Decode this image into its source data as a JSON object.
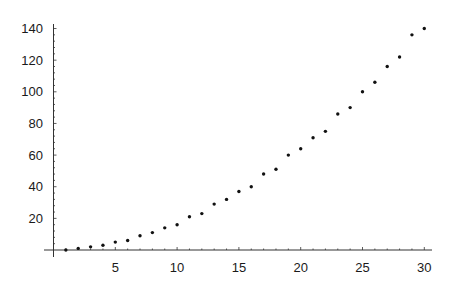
{
  "chart_data": {
    "type": "scatter",
    "title": "",
    "xlabel": "",
    "ylabel": "",
    "xlim": [
      0,
      30.5
    ],
    "ylim": [
      0,
      140
    ],
    "grid": false,
    "legend": null,
    "x_ticks": [
      5,
      10,
      15,
      20,
      25,
      30
    ],
    "y_ticks": [
      20,
      40,
      60,
      80,
      100,
      120,
      140
    ],
    "x_tick_labels": [
      "5",
      "10",
      "15",
      "20",
      "25",
      "30"
    ],
    "y_tick_labels": [
      "20",
      "40",
      "60",
      "80",
      "100",
      "120",
      "140"
    ],
    "series": [
      {
        "name": "points",
        "marker_color": "#111111",
        "x": [
          1,
          2,
          3,
          4,
          5,
          6,
          7,
          8,
          9,
          10,
          11,
          12,
          13,
          14,
          15,
          16,
          17,
          18,
          19,
          20,
          21,
          22,
          23,
          24,
          25,
          26,
          27,
          28,
          29,
          30
        ],
        "values": [
          0,
          1,
          2,
          3,
          5,
          6,
          9,
          11,
          14,
          16,
          21,
          23,
          29,
          32,
          37,
          40,
          48,
          51,
          60,
          64,
          71,
          75,
          86,
          90,
          100,
          106,
          116,
          122,
          136,
          140
        ]
      }
    ]
  }
}
